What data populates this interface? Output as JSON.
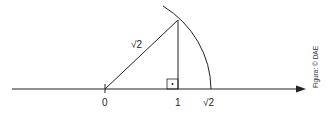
{
  "diagram": {
    "type": "number-line-construction",
    "labels": {
      "zero": "0",
      "one": "1",
      "sqrt2_axis": "√2",
      "hypotenuse": "√2"
    },
    "credit": "Figura: © DAE",
    "colors": {
      "stroke": "#222222",
      "background": "#ffffff"
    }
  }
}
